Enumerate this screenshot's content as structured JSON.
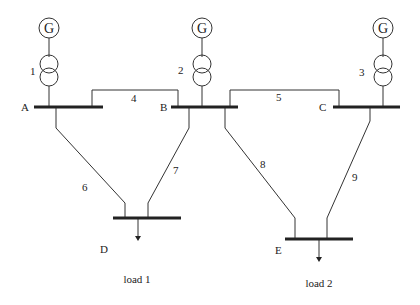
{
  "diagram": {
    "type": "power-system-single-line",
    "generators": [
      {
        "id": "G1",
        "label": "G",
        "transformer": "1",
        "bus": "A"
      },
      {
        "id": "G2",
        "label": "G",
        "transformer": "2",
        "bus": "B"
      },
      {
        "id": "G3",
        "label": "G",
        "transformer": "3",
        "bus": "C"
      }
    ],
    "buses": [
      {
        "id": "A",
        "label": "A"
      },
      {
        "id": "B",
        "label": "B"
      },
      {
        "id": "C",
        "label": "C"
      },
      {
        "id": "D",
        "label": "D"
      },
      {
        "id": "E",
        "label": "E"
      }
    ],
    "lines": [
      {
        "label": "4",
        "from": "A",
        "to": "B"
      },
      {
        "label": "5",
        "from": "B",
        "to": "C"
      },
      {
        "label": "6",
        "from": "A",
        "to": "D"
      },
      {
        "label": "7",
        "from": "B",
        "to": "D"
      },
      {
        "label": "8",
        "from": "B",
        "to": "E"
      },
      {
        "label": "9",
        "from": "C",
        "to": "E"
      }
    ],
    "loads": [
      {
        "label": "load 1",
        "bus": "D"
      },
      {
        "label": "load 2",
        "bus": "E"
      }
    ]
  }
}
